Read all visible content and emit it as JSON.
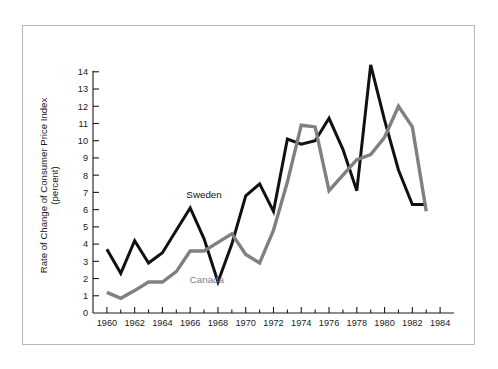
{
  "figure": {
    "frame_color": "#b8b8b8",
    "background": "#ffffff"
  },
  "chart_data": {
    "type": "line",
    "title": "",
    "subtitle": "",
    "xlabel": "",
    "ylabel": "Rate of Change of Consumer Price Index",
    "ylabel_line2": "(percent)",
    "xlim": [
      1959,
      1985
    ],
    "ylim": [
      0,
      14.8
    ],
    "grid": false,
    "legend_position": "inline-annotations",
    "x_ticks": [
      1960,
      1962,
      1964,
      1966,
      1968,
      1970,
      1972,
      1974,
      1976,
      1978,
      1980,
      1982,
      1984
    ],
    "x_tick_labels": [
      "1960",
      "1962",
      "1964",
      "1966",
      "1968",
      "1970",
      "1972",
      "1974",
      "1976",
      "1978",
      "1980",
      "1982",
      "1984"
    ],
    "x_minor_ticks": [
      1961,
      1963,
      1965,
      1967,
      1969,
      1971,
      1973,
      1975,
      1977,
      1979,
      1981,
      1983
    ],
    "y_ticks": [
      0,
      1,
      2,
      3,
      4,
      5,
      6,
      7,
      8,
      9,
      10,
      11,
      12,
      13,
      14
    ],
    "y_tick_labels": [
      "0",
      "1",
      "2",
      "3",
      "4",
      "5",
      "6",
      "7",
      "8",
      "9",
      "10",
      "11",
      "12",
      "13",
      "14"
    ],
    "x": [
      1960,
      1961,
      1962,
      1963,
      1964,
      1965,
      1966,
      1967,
      1968,
      1969,
      1970,
      1971,
      1972,
      1973,
      1974,
      1975,
      1976,
      1977,
      1978,
      1979,
      1980,
      1981,
      1982,
      1983
    ],
    "series": [
      {
        "name": "Sweden",
        "color": "#111111",
        "width": 3.0,
        "label_x": 1967.0,
        "label_y": 6.7,
        "values": [
          3.7,
          2.3,
          4.2,
          2.9,
          3.5,
          4.8,
          6.1,
          4.3,
          1.8,
          4.0,
          6.8,
          7.5,
          5.9,
          10.1,
          9.8,
          10.0,
          11.3,
          9.5,
          7.1,
          14.4,
          11.2,
          8.3,
          6.3,
          6.3
        ]
      },
      {
        "name": "Canada",
        "color": "#808080",
        "width": 3.4,
        "label_x": 1967.2,
        "label_y": 1.75,
        "values": [
          1.2,
          0.85,
          1.3,
          1.8,
          1.8,
          2.4,
          3.6,
          3.6,
          4.1,
          4.6,
          3.4,
          2.9,
          4.8,
          7.6,
          10.9,
          10.8,
          7.1,
          8.0,
          8.9,
          9.2,
          10.2,
          12.0,
          10.8,
          5.9
        ]
      }
    ],
    "annotations": [
      {
        "text": "Sweden",
        "color": "#111111"
      },
      {
        "text": "Canada",
        "color": "#808080"
      }
    ]
  }
}
